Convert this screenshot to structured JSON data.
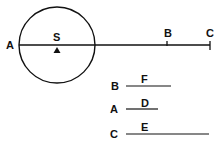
{
  "diagram": {
    "circle": {
      "cx": 57,
      "cy": 45,
      "r": 38
    },
    "main_line": {
      "x1": 19,
      "x2": 210,
      "y": 45
    },
    "labels": {
      "a": "A",
      "s": "S",
      "b": "B",
      "c": "C"
    },
    "segments": [
      {
        "end_label": "B",
        "segment_label": "F"
      },
      {
        "end_label": "A",
        "segment_label": "D"
      },
      {
        "end_label": "C",
        "segment_label": "E"
      }
    ],
    "colors": {
      "stroke": "#111111",
      "background": "#ffffff"
    }
  }
}
